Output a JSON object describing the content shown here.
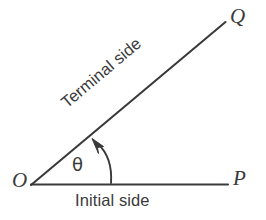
{
  "figure": {
    "background_color": "#ffffff",
    "stroke_color": "#3a3a3a",
    "labels": {
      "vertex": "O",
      "initial_point": "P",
      "terminal_point": "Q",
      "angle_symbol": "θ",
      "initial_side": "Initial side",
      "terminal_side": "Terminal side"
    },
    "geometry": {
      "vertex_xy": [
        31,
        185
      ],
      "initial_end_xy": [
        228,
        184
      ],
      "terminal_end_xy": [
        225,
        22
      ],
      "angle_degrees": 40,
      "arc_start_xy": [
        110,
        183
      ],
      "arrow_tip_xy": [
        93,
        140
      ]
    }
  }
}
